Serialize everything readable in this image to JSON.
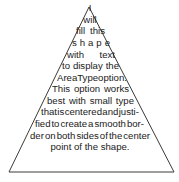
{
  "shape": {
    "type": "triangle",
    "stroke_color": "#3a3a3a",
    "fill_color": "#ffffff"
  },
  "text_lines": [
    {
      "words": [
        "I"
      ],
      "y": 2,
      "left": 87,
      "right": 93
    },
    {
      "words": [
        "will"
      ],
      "y": 14,
      "left": 81,
      "right": 99
    },
    {
      "words": [
        "fill",
        "this"
      ],
      "y": 25,
      "left": 76,
      "right": 105
    },
    {
      "words": [
        "s",
        "h",
        "a",
        "p",
        "e"
      ],
      "y": 37,
      "left": 72,
      "right": 110
    },
    {
      "words": [
        "with",
        "text"
      ],
      "y": 49,
      "left": 67,
      "right": 115
    },
    {
      "words": [
        "to",
        "display",
        "the"
      ],
      "y": 60,
      "left": 62,
      "right": 119
    },
    {
      "words": [
        "Area",
        "Type",
        "option."
      ],
      "y": 72,
      "left": 57,
      "right": 124
    },
    {
      "words": [
        "This",
        "option",
        "works"
      ],
      "y": 83,
      "left": 52,
      "right": 129
    },
    {
      "words": [
        "best",
        "with",
        "small",
        "type"
      ],
      "y": 95,
      "left": 47,
      "right": 134
    },
    {
      "words": [
        "that",
        "is",
        "centered",
        "and",
        "justi-"
      ],
      "y": 106,
      "left": 41,
      "right": 139
    },
    {
      "words": [
        "fied",
        "to",
        "create",
        "a",
        "smooth",
        "bor-"
      ],
      "y": 118,
      "left": 35,
      "right": 144
    },
    {
      "words": [
        "der",
        "on",
        "both",
        "sides",
        "of",
        "the",
        "center"
      ],
      "y": 130,
      "left": 30,
      "right": 150
    },
    {
      "words": [
        "point of the shape."
      ],
      "y": 141,
      "left": 60,
      "right": 120,
      "center": true
    }
  ]
}
